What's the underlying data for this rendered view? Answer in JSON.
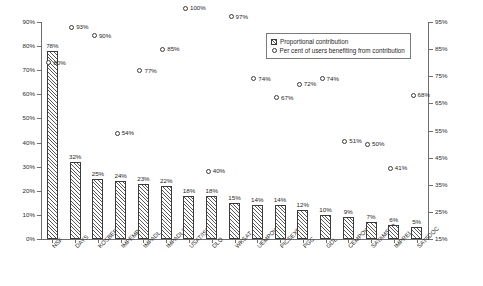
{
  "chart_data": {
    "type": "bar",
    "title": "",
    "subtitle": "",
    "xlabel": "",
    "ylabel": "",
    "categories": [
      "NSF",
      "DAYS",
      "KOSBERG",
      "IMPEMP",
      "IMPADL",
      "IMPADL2",
      "USAT/ISF",
      "DLO",
      "WKSAT",
      "UEMPOW",
      "PICSEXP",
      "PGC",
      "GDL",
      "CEMPOW",
      "SATAMSUP",
      "IMPREL",
      "SAT5DOC"
    ],
    "series": [
      {
        "name": "Proportional contribution",
        "axis": "left",
        "marker": "hatched-bar",
        "values": [
          78,
          32,
          25,
          24,
          23,
          22,
          18,
          18,
          15,
          14,
          14,
          12,
          10,
          9,
          7,
          6,
          5
        ],
        "labels": [
          "78%",
          "32%",
          "25%",
          "24%",
          "23%",
          "22%",
          "18%",
          "18%",
          "15%",
          "14%",
          "14%",
          "12%",
          "10%",
          "9%",
          "7%",
          "6%",
          "5%"
        ]
      },
      {
        "name": "Per cent of users benefiting from contribution",
        "axis": "right",
        "marker": "open-circle",
        "values": [
          80,
          93,
          90,
          54,
          77,
          85,
          100,
          40,
          97,
          74,
          67,
          72,
          74,
          51,
          50,
          41,
          68
        ],
        "labels": [
          "80%",
          "93%",
          "90%",
          "54%",
          "77%",
          "85%",
          "100%",
          "40%",
          "97%",
          "74%",
          "67%",
          "72%",
          "74%",
          "51%",
          "50%",
          "41%",
          "68%"
        ]
      }
    ],
    "left_axis": {
      "ticks": [
        "0%",
        "10%",
        "20%",
        "30%",
        "40%",
        "50%",
        "60%",
        "70%",
        "80%",
        "90%"
      ],
      "min": 0,
      "max": 90,
      "grid": false
    },
    "right_axis": {
      "ticks": [
        "15%",
        "25%",
        "35%",
        "45%",
        "55%",
        "65%",
        "75%",
        "85%",
        "95%"
      ],
      "min": 15,
      "max": 95,
      "grid": false
    },
    "legend": {
      "position": "top-right",
      "entries": [
        {
          "label": "Proportional contribution",
          "marker": "hatched-square"
        },
        {
          "label": "Per cent of users benefiting from contribution",
          "marker": "open-circle"
        }
      ]
    }
  }
}
